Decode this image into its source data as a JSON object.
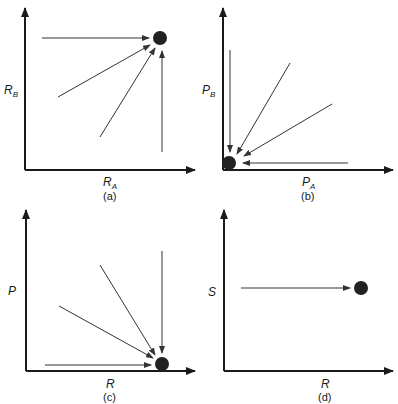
{
  "panels": [
    {
      "id": "a",
      "caption": "(a)",
      "x_label": {
        "main": "R",
        "sub": "A"
      },
      "y_label": {
        "main": "R",
        "sub": "B"
      },
      "dot_color": "#222222",
      "description": "Four arrows converge onto a point at high R_A, high R_B (upper right)"
    },
    {
      "id": "b",
      "caption": "(b)",
      "x_label": {
        "main": "P",
        "sub": "A"
      },
      "y_label": {
        "main": "P",
        "sub": "B"
      },
      "dot_color": "#222222",
      "description": "Four arrows converge onto a point at the origin (low P_A, low P_B)"
    },
    {
      "id": "c",
      "caption": "(c)",
      "x_label": {
        "main": "R",
        "sub": ""
      },
      "y_label": {
        "main": "P",
        "sub": ""
      },
      "dot_color": "#222222",
      "description": "Four arrows converge onto a point at high R, low P (lower right)"
    },
    {
      "id": "d",
      "caption": "(d)",
      "x_label": {
        "main": "R",
        "sub": ""
      },
      "y_label": {
        "main": "S",
        "sub": ""
      },
      "dot_color": "#222222",
      "description": "Single horizontal arrow toward a point at high R, mid S"
    }
  ]
}
